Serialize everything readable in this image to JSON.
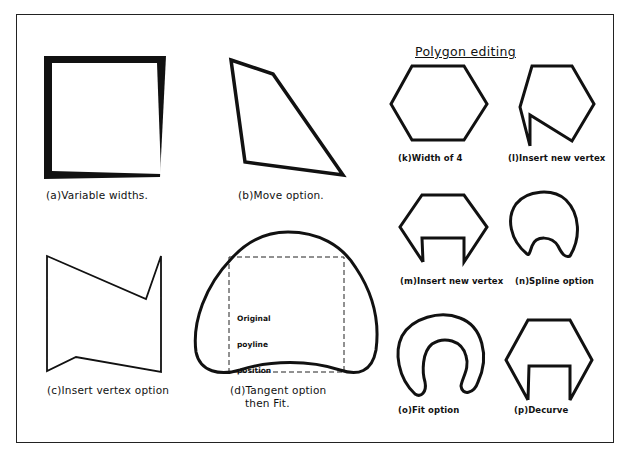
{
  "title": "Polygon editing",
  "figures": {
    "a": {
      "caption": "(a)Variable widths."
    },
    "b": {
      "caption": "(b)Move option."
    },
    "c": {
      "caption": "(c)Insert vertex option"
    },
    "d": {
      "caption_line1": "(d)Tangent option",
      "caption_line2": "then Fit.",
      "note_line1": "Original",
      "note_line2": "poyline",
      "note_line3": "position"
    },
    "k": {
      "caption": "(k)Width of 4"
    },
    "l": {
      "caption": "(l)Insert new vertex"
    },
    "m": {
      "caption": "(m)Insert new vertex"
    },
    "n": {
      "caption": "(n)Spline option"
    },
    "o": {
      "caption": "(o)Fit option"
    },
    "p": {
      "caption": "(p)Decurve"
    }
  },
  "colors": {
    "stroke": "#111111",
    "background": "#ffffff",
    "frame": "#222222"
  }
}
